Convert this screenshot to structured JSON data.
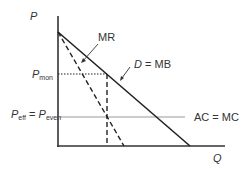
{
  "diagram": {
    "axes": {
      "y_label": "P",
      "x_label": "Q"
    },
    "curves": {
      "mr_label": "MR",
      "demand_label_italic": "D",
      "demand_label_rest": " = MB",
      "cost_label": "AC = MC"
    },
    "prices": {
      "p_mon_main": "P",
      "p_mon_sub": "mon",
      "p_eff_main": "P",
      "p_eff_sub": "eff",
      "equals": " = ",
      "p_even_main": "P",
      "p_even_sub": "even"
    },
    "colors": {
      "line": "#222222",
      "cost_line": "#999999",
      "text": "#333333"
    }
  }
}
